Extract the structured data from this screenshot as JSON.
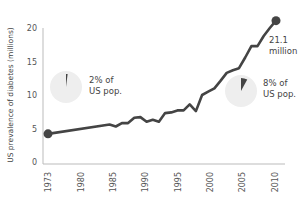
{
  "chart_data": {
    "type": "line",
    "title": "",
    "xlabel": "",
    "ylabel": "US prevalence of diabetes (millions)",
    "ylim": [
      0,
      20
    ],
    "yticks": [
      0,
      5,
      10,
      15,
      20
    ],
    "xticks": [
      "1973",
      "1980",
      "1985",
      "1990",
      "1995",
      "2000",
      "2005",
      "2010"
    ],
    "grid": false,
    "legend": null,
    "series": [
      {
        "name": "US prevalence of diabetes",
        "x": [
          1973,
          1983,
          1984,
          1985,
          1986,
          1987,
          1988,
          1989,
          1990,
          1991,
          1992,
          1993,
          1994,
          1995,
          1996,
          1997,
          1998,
          1999,
          2000,
          2001,
          2002,
          2003,
          2004,
          2005,
          2006,
          2007,
          2008,
          2009,
          2010
        ],
        "values": [
          4.2,
          5.6,
          5.3,
          5.8,
          5.8,
          6.6,
          6.7,
          6.0,
          6.3,
          6.0,
          7.3,
          7.4,
          7.7,
          7.7,
          8.6,
          7.6,
          10.0,
          10.5,
          11.0,
          12.1,
          13.3,
          13.7,
          14.0,
          15.6,
          17.3,
          17.3,
          18.8,
          20.0,
          21.1
        ],
        "color": "#444444"
      }
    ],
    "annotations": [
      {
        "text_line1": "2% of",
        "text_line2": "US pop.",
        "pie_percent": 2
      },
      {
        "text_line1": "8% of",
        "text_line2": "US pop.",
        "pie_percent": 8
      },
      {
        "text_line1": "21.1",
        "text_line2": "million"
      }
    ]
  },
  "colors": {
    "line": "#444444",
    "axis": "#bbbbbb",
    "pie_bg": "#eeeeee",
    "pie_slice": "#444444"
  }
}
